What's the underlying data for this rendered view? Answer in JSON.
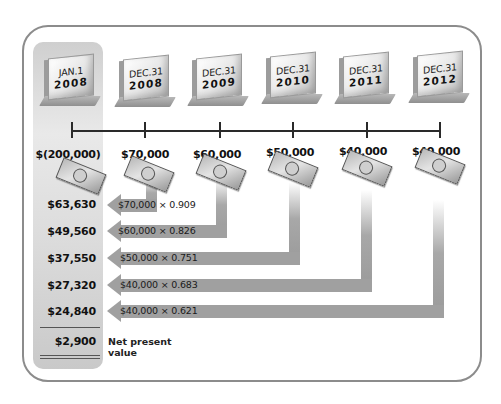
{
  "diagram": {
    "accent_colors": {
      "frame": "#8c8c8c",
      "arrow": "#a0a0a0",
      "column": "#d6d6d6"
    },
    "dates": [
      {
        "line1": "JAN.1",
        "line2": "2008"
      },
      {
        "line1": "DEC.31",
        "line2": "2008"
      },
      {
        "line1": "DEC.31",
        "line2": "2009"
      },
      {
        "line1": "DEC.31",
        "line2": "2010"
      },
      {
        "line1": "DEC.31",
        "line2": "2011"
      },
      {
        "line1": "DEC.31",
        "line2": "2012"
      }
    ],
    "cash_flows": [
      "$(200,000)",
      "$70,000",
      "$60,000",
      "$50,000",
      "$40,000",
      "$40,000"
    ],
    "discount_rows": [
      {
        "present_value": "$63,630",
        "calc": "$70,000 × 0.909"
      },
      {
        "present_value": "$49,560",
        "calc": "$60,000 × 0.826"
      },
      {
        "present_value": "$37,550",
        "calc": "$50,000 × 0.751"
      },
      {
        "present_value": "$27,320",
        "calc": "$40,000 × 0.683"
      },
      {
        "present_value": "$24,840",
        "calc": "$40,000 × 0.621"
      }
    ],
    "net_present_value": "$2,900",
    "net_present_value_label_line1": "Net present",
    "net_present_value_label_line2": "value",
    "icons": {
      "bill": "dollar-bill-icon",
      "date_block": "calendar-block-icon",
      "arrow": "left-arrow-icon"
    }
  }
}
